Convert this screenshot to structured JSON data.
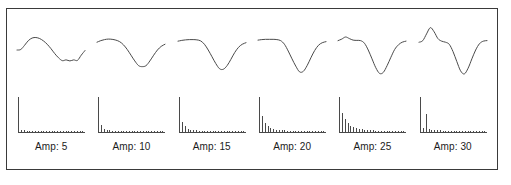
{
  "figure": {
    "border_color": "#3a3a3a",
    "background_color": "#ffffff",
    "trace_color": "#4a4a4a",
    "label_color": "#1b1b1b"
  },
  "panels": [
    {
      "label": "Amp: 5"
    },
    {
      "label": "Amp: 10"
    },
    {
      "label": "Amp: 15"
    },
    {
      "label": "Amp: 20"
    },
    {
      "label": "Amp: 25"
    },
    {
      "label": "Amp: 30"
    }
  ],
  "chart_data": [
    {
      "type": "line",
      "title": "Amp: 5",
      "panel_index": 0,
      "role": "waveform",
      "xlabel": "",
      "ylabel": "",
      "xlim": [
        0,
        72
      ],
      "ylim": [
        -1,
        1
      ],
      "grid": false,
      "legend": "none",
      "x": [
        0,
        4,
        8,
        12,
        16,
        20,
        24,
        28,
        32,
        36,
        40,
        44,
        48,
        52,
        56,
        60,
        64,
        68,
        72
      ],
      "y": [
        0.0,
        0.02,
        0.18,
        0.36,
        0.46,
        0.48,
        0.44,
        0.35,
        0.22,
        0.05,
        -0.14,
        -0.3,
        -0.41,
        -0.38,
        -0.42,
        -0.38,
        -0.4,
        -0.2,
        -0.02
      ]
    },
    {
      "type": "bar",
      "title": "Amp: 5 spectrum",
      "panel_index": 0,
      "role": "spectrum",
      "xlabel": "",
      "ylabel": "",
      "ylim": [
        0,
        1
      ],
      "grid": false,
      "legend": "none",
      "categories": [
        "1",
        "2",
        "3",
        "4",
        "5",
        "6",
        "7",
        "8",
        "9",
        "10",
        "11",
        "12",
        "13",
        "14",
        "15",
        "16",
        "17",
        "18",
        "19",
        "20",
        "21",
        "22",
        "23",
        "24"
      ],
      "values": [
        1.0,
        0.07,
        0.05,
        0.035,
        0.03,
        0.03,
        0.028,
        0.025,
        0.025,
        0.022,
        0.022,
        0.02,
        0.02,
        0.02,
        0.018,
        0.018,
        0.018,
        0.016,
        0.016,
        0.015,
        0.015,
        0.014,
        0.014,
        0.012
      ]
    },
    {
      "type": "line",
      "title": "Amp: 10",
      "panel_index": 1,
      "role": "waveform",
      "xlabel": "",
      "ylabel": "",
      "xlim": [
        0,
        72
      ],
      "ylim": [
        -1,
        1
      ],
      "grid": false,
      "legend": "none",
      "x": [
        0,
        4,
        8,
        12,
        16,
        20,
        24,
        28,
        32,
        36,
        40,
        44,
        48,
        52,
        56,
        60,
        64,
        68,
        72
      ],
      "y": [
        0.3,
        0.36,
        0.4,
        0.42,
        0.41,
        0.38,
        0.32,
        0.2,
        0.02,
        -0.2,
        -0.42,
        -0.6,
        -0.64,
        -0.6,
        -0.42,
        -0.2,
        0.0,
        0.14,
        0.22
      ]
    },
    {
      "type": "bar",
      "title": "Amp: 10 spectrum",
      "panel_index": 1,
      "role": "spectrum",
      "xlabel": "",
      "ylabel": "",
      "ylim": [
        0,
        1
      ],
      "grid": false,
      "legend": "none",
      "categories": [
        "1",
        "2",
        "3",
        "4",
        "5",
        "6",
        "7",
        "8",
        "9",
        "10",
        "11",
        "12",
        "13",
        "14",
        "15",
        "16",
        "17",
        "18",
        "19",
        "20",
        "21",
        "22",
        "23",
        "24"
      ],
      "values": [
        1.0,
        0.2,
        0.1,
        0.06,
        0.045,
        0.04,
        0.035,
        0.03,
        0.03,
        0.028,
        0.026,
        0.025,
        0.024,
        0.022,
        0.022,
        0.02,
        0.02,
        0.018,
        0.018,
        0.016,
        0.016,
        0.015,
        0.014,
        0.013
      ]
    },
    {
      "type": "line",
      "title": "Amp: 15",
      "panel_index": 2,
      "role": "waveform",
      "xlabel": "",
      "ylabel": "",
      "xlim": [
        0,
        72
      ],
      "ylim": [
        -1,
        1
      ],
      "grid": false,
      "legend": "none",
      "x": [
        0,
        4,
        8,
        12,
        16,
        20,
        24,
        28,
        32,
        36,
        40,
        44,
        48,
        52,
        56,
        60,
        64,
        68,
        72
      ],
      "y": [
        0.34,
        0.37,
        0.39,
        0.4,
        0.4,
        0.39,
        0.35,
        0.22,
        0.0,
        -0.26,
        -0.52,
        -0.72,
        -0.74,
        -0.6,
        -0.36,
        -0.1,
        0.1,
        0.22,
        0.28
      ]
    },
    {
      "type": "bar",
      "title": "Amp: 15 spectrum",
      "panel_index": 2,
      "role": "spectrum",
      "xlabel": "",
      "ylabel": "",
      "ylim": [
        0,
        1
      ],
      "grid": false,
      "legend": "none",
      "categories": [
        "1",
        "2",
        "3",
        "4",
        "5",
        "6",
        "7",
        "8",
        "9",
        "10",
        "11",
        "12",
        "13",
        "14",
        "15",
        "16",
        "17",
        "18",
        "19",
        "20",
        "21",
        "22",
        "23",
        "24"
      ],
      "values": [
        1.0,
        0.3,
        0.16,
        0.1,
        0.07,
        0.055,
        0.045,
        0.04,
        0.035,
        0.032,
        0.03,
        0.028,
        0.026,
        0.024,
        0.023,
        0.022,
        0.02,
        0.02,
        0.018,
        0.017,
        0.016,
        0.015,
        0.014,
        0.013
      ]
    },
    {
      "type": "line",
      "title": "Amp: 20",
      "panel_index": 3,
      "role": "waveform",
      "xlabel": "",
      "ylabel": "",
      "xlim": [
        0,
        72
      ],
      "ylim": [
        -1,
        1
      ],
      "grid": false,
      "legend": "none",
      "x": [
        0,
        4,
        8,
        12,
        16,
        20,
        24,
        28,
        32,
        36,
        40,
        44,
        48,
        52,
        56,
        60,
        64,
        68,
        72
      ],
      "y": [
        0.38,
        0.4,
        0.41,
        0.41,
        0.41,
        0.4,
        0.36,
        0.22,
        -0.04,
        -0.34,
        -0.62,
        -0.84,
        -0.82,
        -0.6,
        -0.3,
        -0.02,
        0.18,
        0.28,
        0.32
      ]
    },
    {
      "type": "bar",
      "title": "Amp: 20 spectrum",
      "panel_index": 3,
      "role": "spectrum",
      "xlabel": "",
      "ylabel": "",
      "ylim": [
        0,
        1
      ],
      "grid": false,
      "legend": "none",
      "categories": [
        "1",
        "2",
        "3",
        "4",
        "5",
        "6",
        "7",
        "8",
        "9",
        "10",
        "11",
        "12",
        "13",
        "14",
        "15",
        "16",
        "17",
        "18",
        "19",
        "20",
        "21",
        "22",
        "23",
        "24"
      ],
      "values": [
        1.0,
        0.45,
        0.26,
        0.17,
        0.12,
        0.09,
        0.07,
        0.06,
        0.05,
        0.045,
        0.04,
        0.038,
        0.035,
        0.032,
        0.03,
        0.028,
        0.027,
        0.025,
        0.024,
        0.022,
        0.034,
        0.03,
        0.02,
        0.018
      ]
    },
    {
      "type": "line",
      "title": "Amp: 25",
      "panel_index": 4,
      "role": "waveform",
      "xlabel": "",
      "ylabel": "",
      "xlim": [
        0,
        72
      ],
      "ylim": [
        -1,
        1
      ],
      "grid": false,
      "legend": "none",
      "x": [
        0,
        4,
        8,
        12,
        16,
        20,
        24,
        28,
        32,
        36,
        40,
        44,
        48,
        52,
        56,
        60,
        64,
        68,
        72
      ],
      "y": [
        0.36,
        0.42,
        0.5,
        0.44,
        0.38,
        0.37,
        0.36,
        0.26,
        0.0,
        -0.34,
        -0.68,
        -0.9,
        -0.86,
        -0.6,
        -0.28,
        0.02,
        0.2,
        0.3,
        0.34
      ]
    },
    {
      "type": "bar",
      "title": "Amp: 25 spectrum",
      "panel_index": 4,
      "role": "spectrum",
      "xlabel": "",
      "ylabel": "",
      "ylim": [
        0,
        1
      ],
      "grid": false,
      "legend": "none",
      "categories": [
        "1",
        "2",
        "3",
        "4",
        "5",
        "6",
        "7",
        "8",
        "9",
        "10",
        "11",
        "12",
        "13",
        "14",
        "15",
        "16",
        "17",
        "18",
        "19",
        "20",
        "21",
        "22",
        "23",
        "24"
      ],
      "values": [
        1.0,
        0.55,
        0.36,
        0.25,
        0.18,
        0.14,
        0.11,
        0.09,
        0.075,
        0.065,
        0.055,
        0.05,
        0.045,
        0.04,
        0.038,
        0.035,
        0.032,
        0.03,
        0.028,
        0.026,
        0.025,
        0.023,
        0.022,
        0.02
      ]
    },
    {
      "type": "line",
      "title": "Amp: 30",
      "panel_index": 5,
      "role": "waveform",
      "xlabel": "",
      "ylabel": "",
      "xlim": [
        0,
        72
      ],
      "ylim": [
        -1,
        1
      ],
      "grid": false,
      "legend": "none",
      "x": [
        0,
        4,
        8,
        12,
        16,
        20,
        24,
        28,
        32,
        36,
        40,
        44,
        48,
        52,
        56,
        60,
        64,
        68,
        72
      ],
      "y": [
        0.3,
        0.36,
        0.62,
        0.86,
        0.7,
        0.44,
        0.34,
        0.3,
        0.22,
        -0.06,
        -0.44,
        -0.8,
        -0.92,
        -0.7,
        -0.34,
        0.0,
        0.24,
        0.34,
        0.36
      ]
    },
    {
      "type": "bar",
      "title": "Amp: 30 spectrum",
      "panel_index": 5,
      "role": "spectrum",
      "xlabel": "",
      "ylabel": "",
      "ylim": [
        0,
        1
      ],
      "grid": false,
      "legend": "none",
      "categories": [
        "1",
        "2",
        "3",
        "4",
        "5",
        "6",
        "7",
        "8",
        "9",
        "10",
        "11",
        "12",
        "13",
        "14",
        "15",
        "16",
        "17",
        "18",
        "19",
        "20",
        "21",
        "22",
        "23",
        "24"
      ],
      "values": [
        1.0,
        0.12,
        0.52,
        0.1,
        0.07,
        0.06,
        0.05,
        0.045,
        0.04,
        0.038,
        0.035,
        0.033,
        0.03,
        0.028,
        0.027,
        0.025,
        0.024,
        0.022,
        0.021,
        0.02,
        0.019,
        0.018,
        0.017,
        0.016
      ]
    }
  ]
}
